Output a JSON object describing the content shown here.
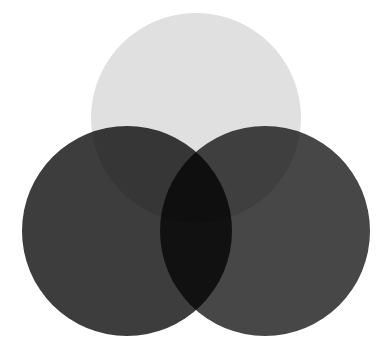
{
  "figure": {
    "kind": "venn-diagram",
    "title": "",
    "background_color": "#ffffff",
    "width": 392,
    "height": 347,
    "blend_mode": "multiply",
    "set_count": 3
  },
  "chart_data": {
    "type": "venn",
    "title": "",
    "subtitle": "",
    "xlabel": "",
    "ylabel": "",
    "grid": false,
    "legend_position": "none",
    "annotations": [],
    "sets": [
      {
        "id": "set-top",
        "name": "",
        "label": "",
        "position": "top",
        "center_x": 196,
        "center_y": 118,
        "radius": 105,
        "fill": "#e0e0e0",
        "opacity": 1,
        "value": null
      },
      {
        "id": "set-left",
        "name": "",
        "label": "",
        "position": "bottom-left",
        "center_x": 127,
        "center_y": 231,
        "radius": 105,
        "fill": "#3d3d3d",
        "opacity": 1,
        "value": null
      },
      {
        "id": "set-right",
        "name": "",
        "label": "",
        "position": "bottom-right",
        "center_x": 265,
        "center_y": 231,
        "radius": 105,
        "fill": "#474747",
        "opacity": 1,
        "value": null
      }
    ],
    "regions": [
      {
        "id": "top-only",
        "members": [
          "set-top"
        ],
        "observed_color": "#e0e0e0",
        "label": "",
        "value": null
      },
      {
        "id": "left-only",
        "members": [
          "set-left"
        ],
        "observed_color": "#3d3d3d",
        "label": "",
        "value": null
      },
      {
        "id": "right-only",
        "members": [
          "set-right"
        ],
        "observed_color": "#474747",
        "label": "",
        "value": null
      },
      {
        "id": "top-left",
        "members": [
          "set-top",
          "set-left"
        ],
        "observed_color": "#6e6e6e",
        "label": "",
        "value": null
      },
      {
        "id": "top-right",
        "members": [
          "set-top",
          "set-right"
        ],
        "observed_color": "#787878",
        "label": "",
        "value": null
      },
      {
        "id": "left-right",
        "members": [
          "set-left",
          "set-right"
        ],
        "observed_color": "#2a2a2a",
        "label": "",
        "value": null
      },
      {
        "id": "all-three",
        "members": [
          "set-top",
          "set-left",
          "set-right"
        ],
        "observed_color": "#060606",
        "label": "",
        "value": null
      }
    ]
  }
}
